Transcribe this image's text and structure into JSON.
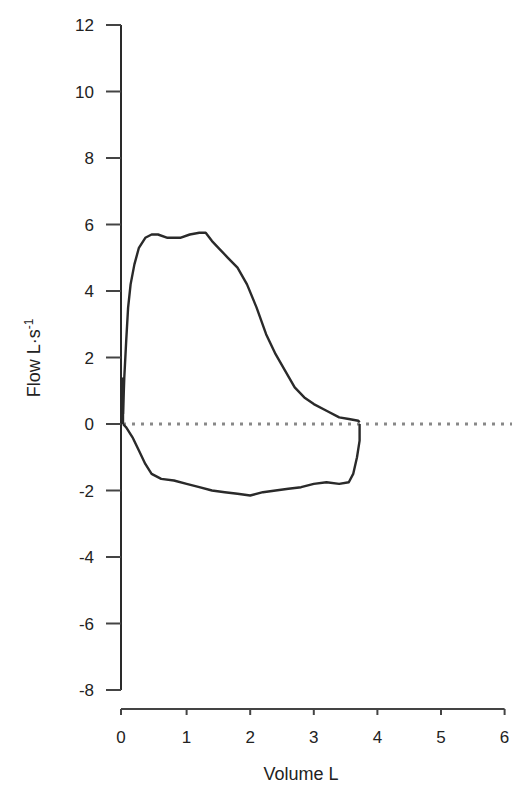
{
  "chart_data": {
    "type": "line",
    "title": "",
    "xlabel": "Volume L",
    "ylabel": "Flow L·s⁻¹",
    "ylabel_base": "Flow L·s",
    "ylabel_sup": "-1",
    "xlim": [
      0,
      6
    ],
    "ylim": [
      -8,
      12
    ],
    "xticks": [
      0,
      1,
      2,
      3,
      4,
      5,
      6
    ],
    "yticks": [
      12,
      10,
      8,
      6,
      4,
      2,
      0,
      -2,
      -4,
      -6,
      -8
    ],
    "grid": false,
    "legend": null,
    "reference_line": {
      "y": 0,
      "style": "dotted",
      "color": "#888888"
    },
    "series": [
      {
        "name": "flow-volume loop (expiratory)",
        "x": [
          0.0,
          0.02,
          0.05,
          0.08,
          0.12,
          0.18,
          0.25,
          0.35,
          0.45,
          0.55,
          0.7,
          0.9,
          1.05,
          1.2,
          1.3,
          1.4,
          1.5,
          1.65,
          1.8,
          1.95,
          2.1,
          2.25,
          2.4,
          2.55,
          2.7,
          2.85,
          3.0,
          3.2,
          3.4,
          3.55,
          3.7,
          3.72
        ],
        "y": [
          0.3,
          1.4,
          2.5,
          3.5,
          4.2,
          4.8,
          5.3,
          5.6,
          5.7,
          5.7,
          5.6,
          5.6,
          5.7,
          5.75,
          5.75,
          5.5,
          5.3,
          5.0,
          4.7,
          4.2,
          3.5,
          2.7,
          2.1,
          1.6,
          1.1,
          0.8,
          0.6,
          0.4,
          0.2,
          0.15,
          0.1,
          0.05
        ]
      },
      {
        "name": "flow-volume loop (inspiratory)",
        "x": [
          3.72,
          3.72,
          3.68,
          3.62,
          3.55,
          3.4,
          3.2,
          3.0,
          2.8,
          2.6,
          2.4,
          2.2,
          2.0,
          1.8,
          1.6,
          1.4,
          1.2,
          1.0,
          0.8,
          0.6,
          0.45,
          0.35,
          0.25,
          0.15,
          0.05,
          0.0
        ],
        "y": [
          0.0,
          -0.5,
          -1.0,
          -1.5,
          -1.75,
          -1.8,
          -1.75,
          -1.8,
          -1.9,
          -1.95,
          -2.0,
          -2.05,
          -2.15,
          -2.1,
          -2.05,
          -2.0,
          -1.9,
          -1.8,
          -1.7,
          -1.65,
          -1.5,
          -1.2,
          -0.8,
          -0.4,
          -0.1,
          0.0
        ]
      }
    ]
  }
}
